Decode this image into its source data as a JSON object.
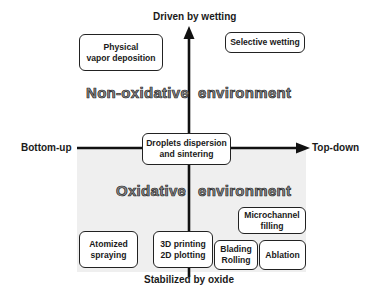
{
  "axes": {
    "top": "Driven by wetting",
    "bottom": "Stabilized by oxide",
    "left": "Bottom-up",
    "right": "Top-down"
  },
  "regions": {
    "upper": {
      "left_word": "Non-oxidative",
      "right_word": "environment"
    },
    "lower": {
      "left_word": "Oxidative",
      "right_word": "environment",
      "fill_color": "#efefef"
    }
  },
  "boxes": {
    "pvd": {
      "line1": "Physical",
      "line2": "vapor deposition"
    },
    "selective_wetting": {
      "line1": "Selective wetting"
    },
    "droplets": {
      "line1": "Droplets dispersion",
      "line2": "and sintering"
    },
    "microchannel": {
      "line1": "Microchannel",
      "line2": "filling"
    },
    "atomized": {
      "line1": "Atomized",
      "line2": "spraying"
    },
    "printing": {
      "line1": "3D printing",
      "line2": "2D plotting"
    },
    "blading": {
      "line1": "Blading",
      "line2": "Rolling"
    },
    "ablation": {
      "line1": "Ablation"
    }
  },
  "colors": {
    "axis": "#111111",
    "region_text_fill": "#8a8a8a",
    "box_border": "#222222"
  }
}
